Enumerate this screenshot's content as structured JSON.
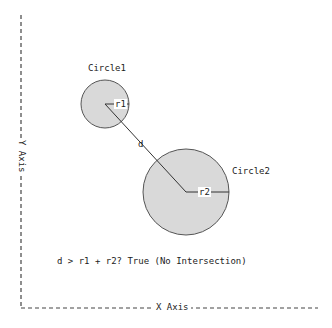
{
  "diagram": {
    "circle1": {
      "label": "Circle1",
      "radius_label": "r1",
      "cx": 105,
      "cy": 104,
      "r": 24
    },
    "circle2": {
      "label": "Circle2",
      "radius_label": "r2",
      "cx": 186,
      "cy": 192,
      "r": 43
    },
    "distance_label": "d",
    "condition_text": "d > r1 + r2? True (No Intersection)",
    "x_axis_label": "X Axis",
    "y_axis_label": "Y Axis",
    "colors": {
      "fill": "#d9d9d9",
      "stroke": "#444444",
      "axis": "#444444"
    }
  }
}
